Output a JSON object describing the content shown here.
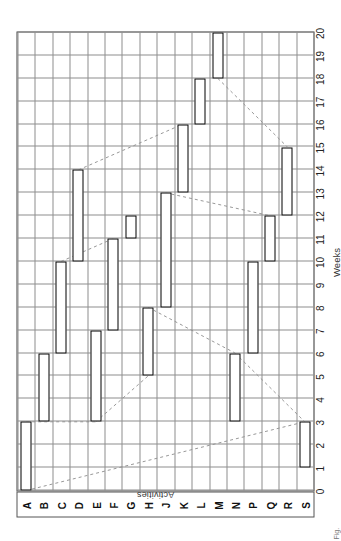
{
  "figure": {
    "caption": "Fig.",
    "x_axis": {
      "label": "Weeks",
      "ticks": [
        "0",
        "1",
        "2",
        "3",
        "4",
        "5",
        "6",
        "7",
        "8",
        "9",
        "10",
        "11",
        "12",
        "13",
        "14",
        "15",
        "16",
        "17",
        "18",
        "19",
        "20"
      ]
    },
    "y_axis": {
      "label": "Activities",
      "ticks": [
        "A",
        "B",
        "C",
        "D",
        "E",
        "F",
        "G",
        "H",
        "J",
        "K",
        "L",
        "M",
        "N",
        "P",
        "Q",
        "R",
        "S"
      ]
    },
    "colors": {
      "bar_outline": "#000000",
      "bar_fill": "#ffffff",
      "grid": "#8d8d8d",
      "frame": "#444444",
      "dependency_line": "#999999"
    }
  },
  "chart_data": {
    "type": "bar",
    "title": "",
    "subtitle": "",
    "orientation": "horizontal-gantt",
    "xlabel": "Weeks",
    "ylabel": "Activities",
    "xlim": [
      0,
      20
    ],
    "grid": true,
    "legend": "none",
    "categories": [
      "A",
      "B",
      "C",
      "D",
      "E",
      "F",
      "G",
      "H",
      "J",
      "K",
      "L",
      "M",
      "N",
      "P",
      "Q",
      "R",
      "S"
    ],
    "bars": [
      {
        "activity": "A",
        "start": 0,
        "finish": 3,
        "duration": 3
      },
      {
        "activity": "B",
        "start": 3,
        "finish": 6,
        "duration": 3
      },
      {
        "activity": "C",
        "start": 6,
        "finish": 10,
        "duration": 4
      },
      {
        "activity": "D",
        "start": 10,
        "finish": 14,
        "duration": 4
      },
      {
        "activity": "E",
        "start": 3,
        "finish": 7,
        "duration": 4
      },
      {
        "activity": "F",
        "start": 7,
        "finish": 11,
        "duration": 4
      },
      {
        "activity": "G",
        "start": 11,
        "finish": 12,
        "duration": 1
      },
      {
        "activity": "H",
        "start": 5,
        "finish": 8,
        "duration": 3
      },
      {
        "activity": "J",
        "start": 8,
        "finish": 13,
        "duration": 5
      },
      {
        "activity": "K",
        "start": 13,
        "finish": 16,
        "duration": 3
      },
      {
        "activity": "L",
        "start": 16,
        "finish": 18,
        "duration": 2
      },
      {
        "activity": "M",
        "start": 18,
        "finish": 20,
        "duration": 2
      },
      {
        "activity": "N",
        "start": 3,
        "finish": 6,
        "duration": 3
      },
      {
        "activity": "P",
        "start": 6,
        "finish": 10,
        "duration": 4
      },
      {
        "activity": "Q",
        "start": 10,
        "finish": 12,
        "duration": 2
      },
      {
        "activity": "R",
        "start": 12,
        "finish": 15,
        "duration": 3
      },
      {
        "activity": "S",
        "start": 1,
        "finish": 3,
        "duration": 2
      }
    ],
    "dependency_lines": [
      {
        "from_activity": "A",
        "from_week": 0,
        "to_activity": "S",
        "to_week": 3
      },
      {
        "from_activity": "A",
        "from_week": 3,
        "to_activity": "E",
        "to_week": 3
      },
      {
        "from_activity": "E",
        "from_week": 3,
        "to_activity": "H",
        "to_week": 5
      },
      {
        "from_activity": "C",
        "from_week": 10,
        "to_activity": "F",
        "to_week": 11
      },
      {
        "from_activity": "D",
        "from_week": 14,
        "to_activity": "K",
        "to_week": 16
      },
      {
        "from_activity": "H",
        "from_week": 8,
        "to_activity": "N",
        "to_week": 6
      },
      {
        "from_activity": "J",
        "from_week": 13,
        "to_activity": "Q",
        "to_week": 12
      },
      {
        "from_activity": "M",
        "from_week": 18,
        "to_activity": "R",
        "to_week": 15
      },
      {
        "from_activity": "N",
        "from_week": 6,
        "to_activity": "S",
        "to_week": 3
      }
    ]
  }
}
